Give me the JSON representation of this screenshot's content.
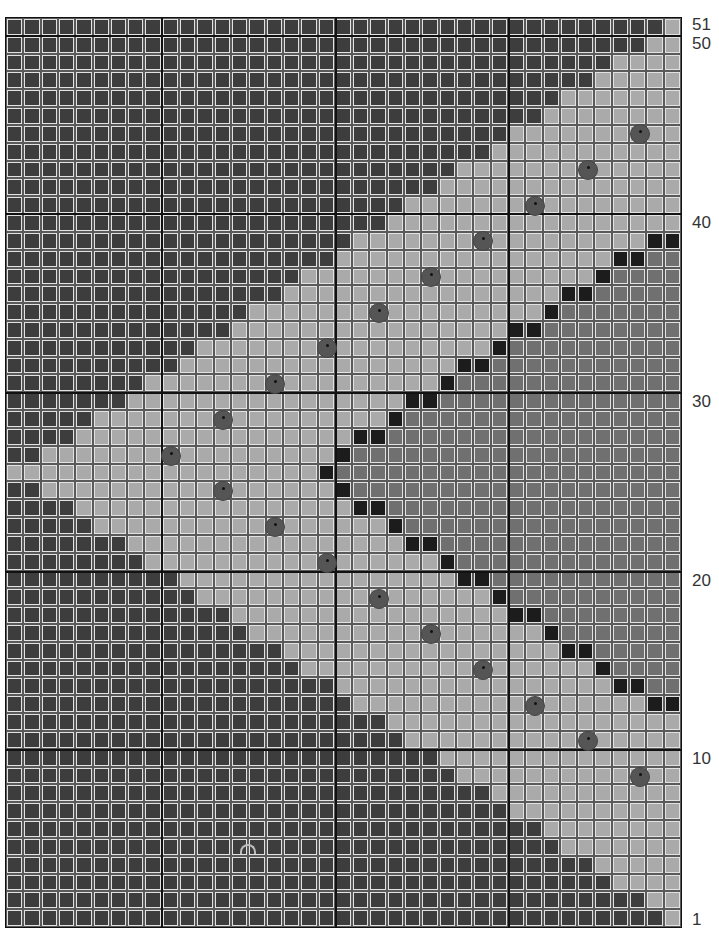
{
  "pattern": {
    "columns": 39,
    "rows": 51,
    "legend_colors": {
      "D": "#3d3d3d",
      "L": "#aaaaaa",
      "M": "#707070",
      "B": "#1c1c1c",
      "dot": "#555555"
    },
    "row_labels": [
      {
        "label": "51",
        "row": 51
      },
      {
        "label": "50",
        "row": 50
      },
      {
        "label": "40",
        "row": 40
      },
      {
        "label": "30",
        "row": 30
      },
      {
        "label": "20",
        "row": 20
      },
      {
        "label": "10",
        "row": 10
      },
      {
        "label": "1",
        "row": 1
      }
    ],
    "thick_rule_rows_below": [
      51,
      41,
      31,
      21,
      11
    ],
    "thick_rule_cols_before": [
      9,
      19,
      29
    ],
    "grid_rows_top_to_bottom": [
      "DDDDDDDDDDDDDDDDDDDDDDDDDDDDDDDDDDDDDDL",
      "DDDDDDDDDDDDDDDDDDDDDDDDDDDDDDDDDDDDDLL",
      "DDDDDDDDDDDDDDDDDDDDDDDDDDDDDDDDDDDLLLL",
      "DDDDDDDDDDDDDDDDDDDDDDDDDDDDDDDDDDLLLLL",
      "DDDDDDDDDDDDDDDDDDDDDDDDDDDDDDDDLLLLLLL",
      "DDDDDDDDDDDDDDDDDDDDDDDDDDDDDDDLLLLLLLL",
      "DDDDDDDDDDDDDDDDDDDDDDDDDDDDDLLLLLLLLLL",
      "DDDDDDDDDDDDDDDDDDDDDDDDDDDDLLLLLLLLLLL",
      "DDDDDDDDDDDDDDDDDDDDDDDDDDLLLLLLLLLLLLL",
      "DDDDDDDDDDDDDDDDDDDDDDDDDLLLLLLLLLLLLLL",
      "DDDDDDDDDDDDDDDDDDDDDDDLLLLLLLLLLLLLLLL",
      "DDDDDDDDDDDDDDDDDDDDDDLLLLLLLLLLLLLLLLL",
      "DDDDDDDDDDDDDDDDDDDDLLLLLLLLLLLLLLLLLBB",
      "DDDDDDDDDDDDDDDDDDDLLLLLLLLLLLLLLLLBBMM",
      "DDDDDDDDDDDDDDDDDLLLLLLLLLLLLLLLLLBMMMM",
      "DDDDDDDDDDDDDDDDLLLLLLLLLLLLLLLLBBMMMMM",
      "DDDDDDDDDDDDDDLLLLLLLLLLLLLLLLLBMMMMMMM",
      "DDDDDDDDDDDDDLLLLLLLLLLLLLLLLBBMMMMMMMM",
      "DDDDDDDDDDDLLLLLLLLLLLLLLLLLBMMMMMMMMMM",
      "DDDDDDDDDDLLLLLLLLLLLLLLLLBBMMMMMMMMMMM",
      "DDDDDDDDLLLLLLLLLLLLLLLLLBMMMMMMMMMMMMM",
      "DDDDDDDLLLLLLLLLLLLLLLLBBMMMMMMMMMMMMMM",
      "DDDDDLLLLLLLLLLLLLLLLLBMMMMMMMMMMMMMMMM",
      "DDDDLLLLLLLLLLLLLLLLBBMMMMMMMMMMMMMMMMM",
      "DDLLLLLLLLLLLLLLLLLBMMMMMMMMMMMMMMMMMMM",
      "LLLLLLLLLLLLLLLLLLBMMMMMMMMMMMMMMMMMMMM",
      "DDLLLLLLLLLLLLLLLLLBMMMMMMMMMMMMMMMMMMM",
      "DDDDLLLLLLLLLLLLLLLLBBMMMMMMMMMMMMMMMMM",
      "DDDDDLLLLLLLLLLLLLLLLLBMMMMMMMMMMMMMMMM",
      "DDDDDDDLLLLLLLLLLLLLLLLBBMMMMMMMMMMMMMM",
      "DDDDDDDDLLLLLLLLLLLLLLLLLBMMMMMMMMMMMMM",
      "DDDDDDDDDDLLLLLLLLLLLLLLLLBBMMMMMMMMMMM",
      "DDDDDDDDDDDLLLLLLLLLLLLLLLLLBMMMMMMMMMM",
      "DDDDDDDDDDDDDLLLLLLLLLLLLLLLLBBMMMMMMMM",
      "DDDDDDDDDDDDDDLLLLLLLLLLLLLLLLLBMMMMMMM",
      "DDDDDDDDDDDDDDDDLLLLLLLLLLLLLLLLBBMMMMM",
      "DDDDDDDDDDDDDDDDDLLLLLLLLLLLLLLLLLBMMMM",
      "DDDDDDDDDDDDDDDDDDDLLLLLLLLLLLLLLLLBBMM",
      "DDDDDDDDDDDDDDDDDDDDLLLLLLLLLLLLLLLLLBB",
      "DDDDDDDDDDDDDDDDDDDDDDLLLLLLLLLLLLLLLLL",
      "DDDDDDDDDDDDDDDDDDDDDDDLLLLLLLLLLLLLLLL",
      "DDDDDDDDDDDDDDDDDDDDDDDDDLLLLLLLLLLLLLL",
      "DDDDDDDDDDDDDDDDDDDDDDDDDDLLLLLLLLLLLLL",
      "DDDDDDDDDDDDDDDDDDDDDDDDDDDDLLLLLLLLLLL",
      "DDDDDDDDDDDDDDDDDDDDDDDDDDDDDLLLLLLLLLL",
      "DDDDDDDDDDDDDDDDDDDDDDDDDDDDDDDLLLLLLLL",
      "DDDDDDDDDDDDDDDDDDDDDDDDDDDDDDDDLLLLLLL",
      "DDDDDDDDDDDDDDDDDDDDDDDDDDDDDDDDDDLLLLL",
      "DDDDDDDDDDDDDDDDDDDDDDDDDDDDDDDDDDDLLLL",
      "DDDDDDDDDDDDDDDDDDDDDDDDDDDDDDDDDDDDDLL",
      "DDDDDDDDDDDDDDDDDDDDDDDDDDDDDDDDDDDDDDL"
    ],
    "dots": [
      {
        "row": 45,
        "col": 36
      },
      {
        "row": 43,
        "col": 33
      },
      {
        "row": 41,
        "col": 30
      },
      {
        "row": 39,
        "col": 27
      },
      {
        "row": 37,
        "col": 24
      },
      {
        "row": 35,
        "col": 21
      },
      {
        "row": 33,
        "col": 18
      },
      {
        "row": 31,
        "col": 15
      },
      {
        "row": 29,
        "col": 12
      },
      {
        "row": 27,
        "col": 9
      },
      {
        "row": 25,
        "col": 12
      },
      {
        "row": 23,
        "col": 15
      },
      {
        "row": 21,
        "col": 18
      },
      {
        "row": 19,
        "col": 21
      },
      {
        "row": 17,
        "col": 24
      },
      {
        "row": 15,
        "col": 27
      },
      {
        "row": 13,
        "col": 30
      },
      {
        "row": 11,
        "col": 33
      },
      {
        "row": 9,
        "col": 36
      }
    ],
    "center_mark": {
      "row": 5,
      "col": 13
    }
  }
}
